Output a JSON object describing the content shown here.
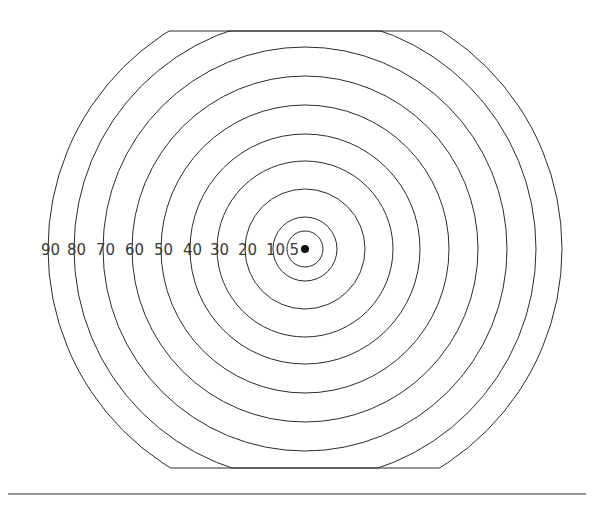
{
  "figure": {
    "background_color": "#ffffff",
    "stroke_color": "#2b2b2b",
    "label_color": "#3a3a3a",
    "dot_color": "#111111",
    "center": {
      "x": 305,
      "y": 249
    },
    "clip_band": {
      "top_y": 31,
      "bottom_y": 468
    },
    "baseline": {
      "y": 494,
      "x_start": 8,
      "x_end": 586
    }
  },
  "chart_data": {
    "type": "scatter",
    "xlabel": "",
    "ylabel": "",
    "rings": [
      {
        "label": "5",
        "radius": 18,
        "label_x": 299,
        "label_y": 250
      },
      {
        "label": "10",
        "radius": 32,
        "label_x": 285,
        "label_y": 250
      },
      {
        "label": "20",
        "radius": 60,
        "label_x": 257,
        "label_y": 250
      },
      {
        "label": "30",
        "radius": 88,
        "label_x": 229,
        "label_y": 250
      },
      {
        "label": "40",
        "radius": 115,
        "label_x": 202,
        "label_y": 250
      },
      {
        "label": "50",
        "radius": 144,
        "label_x": 173,
        "label_y": 250
      },
      {
        "label": "60",
        "radius": 173,
        "label_x": 144,
        "label_y": 250
      },
      {
        "label": "70",
        "radius": 202,
        "label_x": 115,
        "label_y": 250
      },
      {
        "label": "80",
        "radius": 231,
        "label_x": 86,
        "label_y": 250
      },
      {
        "label": "90",
        "radius": 257,
        "label_x": 60,
        "label_y": 250
      }
    ],
    "center_dot": {
      "x": 305,
      "y": 249,
      "radius": 4
    },
    "labels": [
      "90",
      "80",
      "70",
      "60",
      "50",
      "40",
      "30",
      "20",
      "10",
      "5"
    ],
    "values": [
      257,
      231,
      202,
      173,
      144,
      115,
      88,
      60,
      32,
      18
    ],
    "grid": false,
    "legend": "none"
  },
  "annotations": {
    "center_dot_name": "aim point",
    "baseline_name": "ground reference line"
  }
}
